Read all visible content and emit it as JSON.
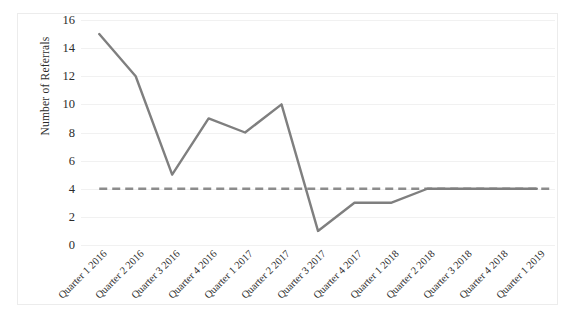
{
  "chart_data": {
    "type": "line",
    "title": "",
    "subtitle": "",
    "xlabel": "",
    "ylabel": "Number of Referrals",
    "ylim": [
      0,
      16
    ],
    "ytick_labels": [
      "0",
      "2",
      "4",
      "6",
      "8",
      "10",
      "12",
      "14",
      "16"
    ],
    "yticks": [
      0,
      2,
      4,
      6,
      8,
      10,
      12,
      14,
      16
    ],
    "grid": "horizontal",
    "legend": "none",
    "categories": [
      "Quarter 1 2016",
      "Quarter 2 2016",
      "Quarter 3 2016",
      "Quarter 4 2016",
      "Quarter 1 2017",
      "Quarter 2 2017",
      "Quarter 3 2017",
      "Quarter 4 2017",
      "Quarter 1 2018",
      "Quarter 2 2018",
      "Quarter 3 2018",
      "Quarter 4 2018",
      "Quarter 1 2019"
    ],
    "series": [
      {
        "name": "Number of Referrals",
        "style": "solid",
        "color": "#7f7f7f",
        "values": [
          15,
          12,
          5,
          9,
          8,
          10,
          1,
          3,
          3,
          4,
          4,
          4,
          4
        ]
      },
      {
        "name": "Target",
        "style": "dashed",
        "color": "#8c8c8c",
        "constant_value": 4,
        "values": [
          4,
          4,
          4,
          4,
          4,
          4,
          4,
          4,
          4,
          4,
          4,
          4,
          4
        ]
      }
    ]
  },
  "axis": {
    "y_title": "Number of Referrals"
  },
  "colors": {
    "line": "#7f7f7f",
    "dashed": "#8c8c8c",
    "gridline": "#f1f1f1",
    "frame": "#ececec",
    "background": "#ffffff",
    "text": "#2b2b2b"
  }
}
